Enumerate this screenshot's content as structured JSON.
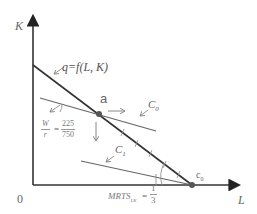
{
  "axes": {
    "y_label": "K",
    "x_label": "L",
    "origin_label": "0"
  },
  "isoquant": {
    "label": "q=f(L, K)",
    "color": "#333333"
  },
  "points": {
    "a": {
      "label": "a"
    },
    "c0": {
      "label": "c",
      "subscript": "0"
    }
  },
  "isocost_lines": {
    "c0": {
      "label": "C",
      "subscript": "0",
      "color": "#666666"
    },
    "c1": {
      "label": "C",
      "subscript": "1",
      "color": "#666666"
    }
  },
  "price_ratio": {
    "num": "W",
    "den": "r",
    "equals": "=",
    "value_num": "225",
    "value_den": "750"
  },
  "mrts": {
    "label": "MRTS",
    "subscript": "LK",
    "equals": "=",
    "value_num": "1",
    "value_den": "3"
  },
  "colors": {
    "axis": "#333333",
    "isoquant": "#333333",
    "isocost": "#666666",
    "arrow": "#888888",
    "point": "#555555"
  }
}
